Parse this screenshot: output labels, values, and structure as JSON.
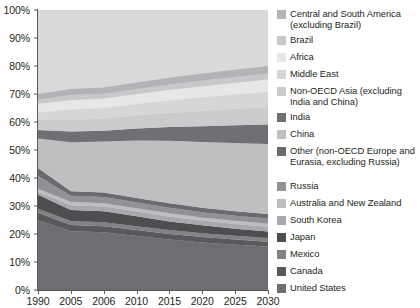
{
  "chart_data": {
    "type": "area",
    "title": "",
    "xlabel": "",
    "ylabel": "",
    "x": [
      1990,
      2005,
      2006,
      2010,
      2015,
      2020,
      2025,
      2030
    ],
    "xtick_labels": [
      "1990",
      "2005",
      "2006",
      "2010",
      "2015",
      "2020",
      "2025",
      "2030"
    ],
    "ytick_labels": [
      "0%",
      "10%",
      "20%",
      "30%",
      "40%",
      "50%",
      "60%",
      "70%",
      "80%",
      "90%",
      "100%"
    ],
    "ytick_values": [
      0,
      10,
      20,
      30,
      40,
      50,
      60,
      70,
      80,
      90,
      100
    ],
    "ylim": [
      0,
      100
    ],
    "stacked": true,
    "normalized_percent": true,
    "grid": false,
    "legend_position": "right",
    "series": [
      {
        "name": "United States",
        "color": "#6d6e71",
        "values": [
          25.0,
          21.0,
          20.6,
          19.3,
          18.0,
          17.0,
          16.2,
          15.5
        ]
      },
      {
        "name": "Canada",
        "color": "#58595b",
        "values": [
          2.6,
          2.2,
          2.2,
          2.1,
          2.0,
          1.9,
          1.8,
          1.7
        ]
      },
      {
        "name": "Mexico",
        "color": "#808285",
        "values": [
          1.4,
          1.4,
          1.4,
          1.4,
          1.4,
          1.4,
          1.4,
          1.4
        ]
      },
      {
        "name": "Japan",
        "color": "#4d4e50",
        "values": [
          5.0,
          4.0,
          3.9,
          3.5,
          3.1,
          2.8,
          2.5,
          2.3
        ]
      },
      {
        "name": "South Korea",
        "color": "#a7a9ac",
        "values": [
          1.0,
          1.7,
          1.7,
          1.7,
          1.7,
          1.7,
          1.7,
          1.7
        ]
      },
      {
        "name": "Australia and New Zealand",
        "color": "#bcbec0",
        "values": [
          1.2,
          1.2,
          1.2,
          1.2,
          1.2,
          1.1,
          1.1,
          1.1
        ]
      },
      {
        "name": "Russia",
        "color": "#909295",
        "values": [
          4.6,
          2.2,
          2.2,
          2.1,
          2.0,
          1.9,
          1.8,
          1.8
        ]
      },
      {
        "name": "Other (non-OECD Europe and Eurasia, excluding Russia)",
        "color": "#6a6b6e",
        "values": [
          2.8,
          1.6,
          1.6,
          1.6,
          1.6,
          1.6,
          1.6,
          1.6
        ]
      },
      {
        "name": "China",
        "color": "#bdbfc1",
        "values": [
          10.5,
          17.5,
          18.2,
          20.5,
          22.3,
          23.5,
          24.4,
          25.0
        ]
      },
      {
        "name": "India",
        "color": "#6f7073",
        "values": [
          3.0,
          3.8,
          3.9,
          4.3,
          4.9,
          5.6,
          6.3,
          7.0
        ]
      },
      {
        "name": "Non-OECD Asia (excluding India and China)",
        "color": "#c9cbcd",
        "values": [
          3.6,
          4.2,
          4.3,
          4.6,
          5.0,
          5.4,
          5.8,
          6.2
        ]
      },
      {
        "name": "Middle East",
        "color": "#d4d6d8",
        "values": [
          2.7,
          3.7,
          3.8,
          4.1,
          4.5,
          4.9,
          5.2,
          5.5
        ]
      },
      {
        "name": "Africa",
        "color": "#e6e7e8",
        "values": [
          3.1,
          3.4,
          3.4,
          3.6,
          3.8,
          4.0,
          4.2,
          4.4
        ]
      },
      {
        "name": "Brazil",
        "color": "#c6c8ca",
        "values": [
          1.5,
          1.7,
          1.7,
          1.8,
          1.9,
          2.0,
          2.1,
          2.2
        ]
      },
      {
        "name": "Central and South America (excluding Brazil)",
        "color": "#b1b3b6",
        "values": [
          2.0,
          2.2,
          2.2,
          2.3,
          2.4,
          2.5,
          2.6,
          2.6
        ]
      }
    ]
  },
  "legend": {
    "items": [
      {
        "label": "Central and South America (excluding Brazil)",
        "color": "#b1b3b6"
      },
      {
        "label": "Brazil",
        "color": "#c6c8ca"
      },
      {
        "label": "Africa",
        "color": "#e6e7e8"
      },
      {
        "label": "Middle East",
        "color": "#d4d6d8"
      },
      {
        "label": "Non-OECD Asia (excluding India and China)",
        "color": "#c9cbcd"
      },
      {
        "label": "India",
        "color": "#6f7073"
      },
      {
        "label": "China",
        "color": "#bdbfc1"
      },
      {
        "label": "Other (non-OECD Europe and Eurasia, excluding Russia)",
        "color": "#6a6b6e"
      },
      {
        "label": "Russia",
        "color": "#909295"
      },
      {
        "label": "Australia and New Zealand",
        "color": "#bcbec0"
      },
      {
        "label": "South Korea",
        "color": "#a7a9ac"
      },
      {
        "label": "Japan",
        "color": "#4d4e50"
      },
      {
        "label": "Mexico",
        "color": "#808285"
      },
      {
        "label": "Canada",
        "color": "#58595b"
      },
      {
        "label": "United States",
        "color": "#6d6e71"
      }
    ]
  }
}
